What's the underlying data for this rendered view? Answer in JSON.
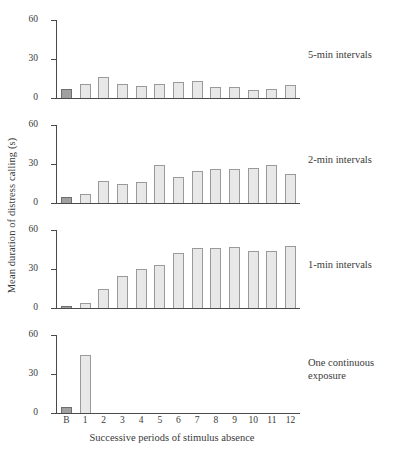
{
  "chart_data": {
    "type": "bar",
    "title": "",
    "xlabel": "Successive periods of stimulus absence",
    "ylabel": "Mean duration of distress calling (s)",
    "ylim": [
      0,
      60
    ],
    "yticks": [
      0,
      30,
      60
    ],
    "ytick_labels": [
      "0",
      "30",
      "60"
    ],
    "categories": [
      "B",
      "1",
      "2",
      "3",
      "4",
      "5",
      "6",
      "7",
      "8",
      "9",
      "10",
      "11",
      "12"
    ],
    "grid": false,
    "legend": "none",
    "bar_colors": {
      "baseline_fill": "#a0a0a0",
      "baseline_edge": "#6e6e6e",
      "bar_fill": "#e8e8e8",
      "bar_edge": "#9a9a9a"
    },
    "panels": [
      {
        "label": "5-min intervals",
        "values": [
          7,
          11,
          16,
          10.5,
          9.5,
          10.5,
          12,
          13,
          8.5,
          8.5,
          6.5,
          7,
          10
        ]
      },
      {
        "label": "2-min intervals",
        "values": [
          5,
          7,
          17,
          15,
          16,
          29,
          20,
          25,
          26,
          26,
          27,
          29,
          22
        ]
      },
      {
        "label": "1-min intervals",
        "values": [
          1.5,
          4,
          15,
          25,
          30,
          33,
          42,
          46,
          46,
          47,
          44,
          44,
          48
        ]
      },
      {
        "label": "One continuous\nexposure",
        "values": [
          5,
          45,
          0,
          0,
          0,
          0,
          0,
          0,
          0,
          0,
          0,
          0,
          0
        ]
      }
    ]
  }
}
